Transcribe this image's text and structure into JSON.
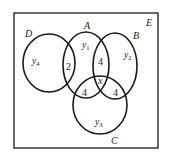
{
  "diagram": {
    "type": "venn",
    "universe": {
      "label": "E",
      "frame": {
        "x": 14,
        "y": 13,
        "width": 144,
        "height": 135
      }
    },
    "sets": [
      {
        "id": "D",
        "label": "D",
        "cx": 49,
        "cy": 63,
        "rx": 26,
        "ry": 29,
        "label_x": 26,
        "label_y": 37
      },
      {
        "id": "A",
        "label": "A",
        "cx": 86,
        "cy": 65,
        "rx": 23,
        "ry": 33,
        "label_x": 85,
        "label_y": 29
      },
      {
        "id": "B",
        "label": "B",
        "cx": 115,
        "cy": 66,
        "rx": 22,
        "ry": 33,
        "label_x": 134,
        "label_y": 39
      },
      {
        "id": "C",
        "label": "C",
        "cx": 100,
        "cy": 105,
        "rx": 27,
        "ry": 29,
        "label_x": 112,
        "label_y": 144
      }
    ],
    "regions": [
      {
        "id": "D_only",
        "var": "y",
        "sub": "4",
        "x": 33,
        "y": 64
      },
      {
        "id": "A_only",
        "var": "y",
        "sub": "1",
        "x": 82,
        "y": 48
      },
      {
        "id": "B_only",
        "var": "y",
        "sub": "2",
        "x": 124,
        "y": 58
      },
      {
        "id": "C_only",
        "var": "y",
        "sub": "3",
        "x": 95,
        "y": 125
      },
      {
        "id": "A_and_D",
        "value": "2",
        "x": 66,
        "y": 69
      },
      {
        "id": "A_and_B",
        "value": "4",
        "x": 98,
        "y": 64
      },
      {
        "id": "A_and_B_and_C",
        "value": "x",
        "italic": true,
        "x": 98,
        "y": 84
      },
      {
        "id": "A_and_C",
        "value": "4",
        "x": 82,
        "y": 96
      },
      {
        "id": "B_and_C",
        "value": "4",
        "x": 113,
        "y": 96
      }
    ],
    "text": {
      "E": "E",
      "D": "D",
      "A": "A",
      "B": "B",
      "C": "C",
      "y4_var": "y",
      "y4_sub": "4",
      "y1_var": "y",
      "y1_sub": "1",
      "y2_var": "y",
      "y2_sub": "2",
      "y3_var": "y",
      "y3_sub": "3",
      "AD": "2",
      "AB": "4",
      "ABC": "x",
      "AC": "4",
      "BC": "4"
    }
  }
}
